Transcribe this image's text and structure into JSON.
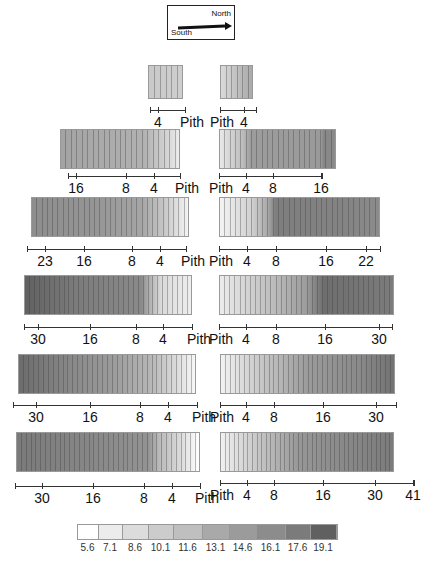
{
  "compass": {
    "north_label": "North",
    "south_label": "South"
  },
  "pith_label": "Pith",
  "legend": {
    "values": [
      "5.6",
      "7.1",
      "8.6",
      "10.1",
      "11.6",
      "13.1",
      "14.6",
      "16.1",
      "17.6",
      "19.1"
    ],
    "colors": [
      "#ffffff",
      "#ececec",
      "#dcdcdc",
      "#cccccc",
      "#bfbfbf",
      "#a9a9a9",
      "#9b9b9b",
      "#8c8c8c",
      "#7b7b7b",
      "#606060"
    ]
  },
  "chart_data": {
    "type": "heatmap",
    "legend_values": [
      5.6,
      7.1,
      8.6,
      10.1,
      11.6,
      13.1,
      14.6,
      16.1,
      17.6,
      19.1
    ],
    "rows": [
      {
        "south_ticks": [
          "4",
          "Pith"
        ],
        "north_ticks": [
          "Pith",
          "4"
        ]
      },
      {
        "south_ticks": [
          "16",
          "8",
          "4",
          "Pith"
        ],
        "north_ticks": [
          "Pith",
          "4",
          "8",
          "16"
        ]
      },
      {
        "south_ticks": [
          "23",
          "16",
          "8",
          "4",
          "Pith"
        ],
        "north_ticks": [
          "Pith",
          "4",
          "8",
          "16",
          "22"
        ]
      },
      {
        "south_ticks": [
          "30",
          "16",
          "8",
          "4",
          "Pith"
        ],
        "north_ticks": [
          "Pith",
          "4",
          "8",
          "16",
          "30"
        ]
      },
      {
        "south_ticks": [
          "30",
          "16",
          "8",
          "4",
          "Pith"
        ],
        "north_ticks": [
          "Pith",
          "4",
          "8",
          "16",
          "30"
        ]
      },
      {
        "south_ticks": [
          "30",
          "16",
          "8",
          "4",
          "Pith"
        ],
        "north_ticks": [
          "Pith",
          "4",
          "8",
          "16",
          "30",
          "41"
        ]
      }
    ]
  },
  "rows": [
    {
      "south": {
        "x": 148,
        "y": 65,
        "w": 35,
        "h": 34,
        "stops": [
          [
            0,
            "#c9c9c9"
          ],
          [
            100,
            "#cfcfcf"
          ]
        ],
        "rings": 6,
        "axis": {
          "x1": 150,
          "x2": 185,
          "y": 110
        },
        "ticks": [
          {
            "x": 158,
            "t": "4"
          },
          {
            "x": 185,
            "t": "Pith",
            "p": 1
          }
        ]
      },
      "north": {
        "x": 220,
        "y": 65,
        "w": 33,
        "h": 34,
        "stops": [
          [
            0,
            "#dadada"
          ],
          [
            60,
            "#bcbcbc"
          ],
          [
            100,
            "#aaaaaa"
          ]
        ],
        "rings": 6,
        "axis": {
          "x1": 220,
          "x2": 256,
          "y": 110
        },
        "ticks": [
          {
            "x": 220,
            "t": "Pith",
            "p": 1
          },
          {
            "x": 244,
            "t": "4"
          }
        ]
      }
    },
    {
      "south": {
        "x": 60,
        "y": 129,
        "w": 120,
        "h": 40,
        "stops": [
          [
            0,
            "#a3a3a3"
          ],
          [
            70,
            "#b1b1b1"
          ],
          [
            90,
            "#d4d4d4"
          ],
          [
            100,
            "#ececec"
          ]
        ],
        "rings": 22,
        "axis": {
          "x1": 68,
          "x2": 180,
          "y": 176
        },
        "ticks": [
          {
            "x": 76,
            "t": "16"
          },
          {
            "x": 126,
            "t": "8"
          },
          {
            "x": 154,
            "t": "4"
          },
          {
            "x": 180,
            "t": "Pith",
            "p": 1
          }
        ]
      },
      "north": {
        "x": 219,
        "y": 129,
        "w": 117,
        "h": 40,
        "stops": [
          [
            0,
            "#e8e8e8"
          ],
          [
            20,
            "#bcbcbc"
          ],
          [
            27,
            "#9c9c9c"
          ],
          [
            88,
            "#9a9a9a"
          ],
          [
            90,
            "#878787"
          ],
          [
            100,
            "#8a8a8a"
          ]
        ],
        "rings": 22,
        "axis": {
          "x1": 219,
          "x2": 322,
          "y": 176
        },
        "ticks": [
          {
            "x": 219,
            "t": "Pith",
            "p": 1
          },
          {
            "x": 246,
            "t": "4"
          },
          {
            "x": 273,
            "t": "8"
          },
          {
            "x": 321,
            "t": "16"
          }
        ]
      }
    },
    {
      "south": {
        "x": 31,
        "y": 197,
        "w": 158,
        "h": 40,
        "stops": [
          [
            0,
            "#8d8d8d"
          ],
          [
            40,
            "#959595"
          ],
          [
            70,
            "#a5a5a5"
          ],
          [
            85,
            "#c8c8c8"
          ],
          [
            100,
            "#f3f3f3"
          ]
        ],
        "rings": 30,
        "axis": {
          "x1": 27,
          "x2": 186,
          "y": 249
        },
        "ticks": [
          {
            "x": 45,
            "t": "23"
          },
          {
            "x": 84,
            "t": "16"
          },
          {
            "x": 132,
            "t": "8"
          },
          {
            "x": 160,
            "t": "4"
          },
          {
            "x": 186,
            "t": "Pith",
            "p": 1
          }
        ]
      },
      "north": {
        "x": 219,
        "y": 197,
        "w": 161,
        "h": 40,
        "stops": [
          [
            0,
            "#f4f4f4"
          ],
          [
            20,
            "#d0d0d0"
          ],
          [
            30,
            "#aaaaaa"
          ],
          [
            35,
            "#7e7e7e"
          ],
          [
            80,
            "#848484"
          ],
          [
            100,
            "#8c8c8c"
          ]
        ],
        "rings": 30,
        "axis": {
          "x1": 219,
          "x2": 380,
          "y": 249
        },
        "ticks": [
          {
            "x": 219,
            "t": "Pith",
            "p": 1
          },
          {
            "x": 247,
            "t": "4"
          },
          {
            "x": 276,
            "t": "8"
          },
          {
            "x": 326,
            "t": "16"
          },
          {
            "x": 366,
            "t": "22"
          }
        ]
      }
    },
    {
      "south": {
        "x": 24,
        "y": 275,
        "w": 168,
        "h": 40,
        "stops": [
          [
            0,
            "#616161"
          ],
          [
            30,
            "#7b7b7b"
          ],
          [
            70,
            "#8a8a8a"
          ],
          [
            74,
            "#aaaaaa"
          ],
          [
            82,
            "#dadada"
          ],
          [
            100,
            "#eeeeee"
          ]
        ],
        "rings": 34,
        "axis": {
          "x1": 24,
          "x2": 192,
          "y": 327
        },
        "ticks": [
          {
            "x": 38,
            "t": "30"
          },
          {
            "x": 90,
            "t": "16"
          },
          {
            "x": 136,
            "t": "8"
          },
          {
            "x": 163,
            "t": "4"
          },
          {
            "x": 192,
            "t": "Pith",
            "p": 1
          }
        ]
      },
      "north": {
        "x": 219,
        "y": 275,
        "w": 175,
        "h": 40,
        "stops": [
          [
            0,
            "#ececec"
          ],
          [
            30,
            "#bdbdbd"
          ],
          [
            50,
            "#9c9c9c"
          ],
          [
            60,
            "#6e6e6e"
          ],
          [
            100,
            "#7c7c7c"
          ]
        ],
        "rings": 34,
        "axis": {
          "x1": 219,
          "x2": 392,
          "y": 327
        },
        "ticks": [
          {
            "x": 219,
            "t": "Pith",
            "p": 1
          },
          {
            "x": 246,
            "t": "4"
          },
          {
            "x": 276,
            "t": "8"
          },
          {
            "x": 325,
            "t": "16"
          },
          {
            "x": 379,
            "t": "30"
          }
        ]
      }
    },
    {
      "south": {
        "x": 18,
        "y": 354,
        "w": 178,
        "h": 40,
        "stops": [
          [
            0,
            "#6c6c6c"
          ],
          [
            30,
            "#898989"
          ],
          [
            55,
            "#9d9d9d"
          ],
          [
            75,
            "#b7b7b7"
          ],
          [
            90,
            "#dcdcdc"
          ],
          [
            100,
            "#f7f7f7"
          ]
        ],
        "rings": 36,
        "axis": {
          "x1": 13,
          "x2": 197,
          "y": 405
        },
        "ticks": [
          {
            "x": 36,
            "t": "30"
          },
          {
            "x": 90,
            "t": "16"
          },
          {
            "x": 140,
            "t": "8"
          },
          {
            "x": 168,
            "t": "4"
          },
          {
            "x": 197,
            "t": "Pith",
            "p": 1
          }
        ]
      },
      "north": {
        "x": 220,
        "y": 354,
        "w": 175,
        "h": 40,
        "stops": [
          [
            0,
            "#f2f2f2"
          ],
          [
            25,
            "#c4c4c4"
          ],
          [
            50,
            "#9b9b9b"
          ],
          [
            80,
            "#8a8a8a"
          ],
          [
            100,
            "#727272"
          ]
        ],
        "rings": 36,
        "axis": {
          "x1": 220,
          "x2": 396,
          "y": 405
        },
        "ticks": [
          {
            "x": 220,
            "t": "Pith",
            "p": 1
          },
          {
            "x": 246,
            "t": "4"
          },
          {
            "x": 274,
            "t": "8"
          },
          {
            "x": 323,
            "t": "16"
          },
          {
            "x": 376,
            "t": "30"
          }
        ]
      }
    },
    {
      "south": {
        "x": 16,
        "y": 432,
        "w": 184,
        "h": 40,
        "stops": [
          [
            0,
            "#7a7a7a"
          ],
          [
            40,
            "#878787"
          ],
          [
            72,
            "#939393"
          ],
          [
            78,
            "#b9b9b9"
          ],
          [
            90,
            "#dadada"
          ],
          [
            100,
            "#ffffff"
          ]
        ],
        "rings": 38,
        "axis": {
          "x1": 15,
          "x2": 200,
          "y": 486
        },
        "ticks": [
          {
            "x": 42,
            "t": "30"
          },
          {
            "x": 93,
            "t": "16"
          },
          {
            "x": 144,
            "t": "8"
          },
          {
            "x": 172,
            "t": "4"
          },
          {
            "x": 200,
            "t": "Pith",
            "p": 1
          }
        ]
      },
      "north": {
        "x": 220,
        "y": 432,
        "w": 174,
        "h": 40,
        "stops": [
          [
            0,
            "#f0f0f0"
          ],
          [
            25,
            "#c0c0c0"
          ],
          [
            45,
            "#979797"
          ],
          [
            80,
            "#858585"
          ],
          [
            100,
            "#7b7b7b"
          ]
        ],
        "rings": 38,
        "axis": {
          "x1": 220,
          "x2": 414,
          "y": 483
        },
        "ticks": [
          {
            "x": 220,
            "t": "Pith",
            "p": 1
          },
          {
            "x": 247,
            "t": "4"
          },
          {
            "x": 274,
            "t": "8"
          },
          {
            "x": 323,
            "t": "16"
          },
          {
            "x": 375,
            "t": "30"
          },
          {
            "x": 413,
            "t": "41"
          }
        ]
      }
    }
  ]
}
